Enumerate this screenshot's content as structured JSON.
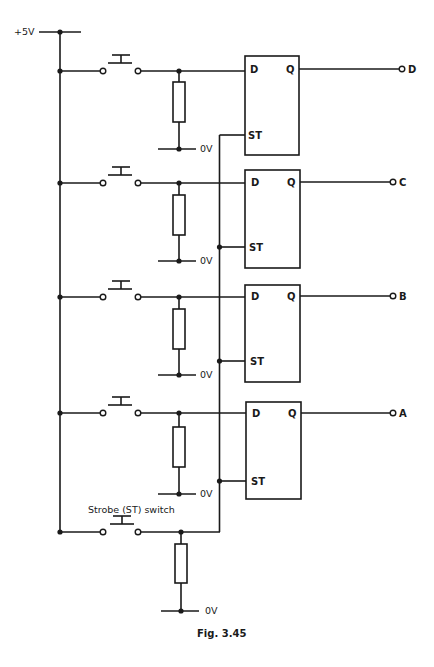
{
  "figure": {
    "caption": "Fig. 3.45",
    "supply_label": "+5V",
    "ground_label": "0V",
    "strobe_switch_label": "Strobe (ST) switch"
  },
  "latches": [
    {
      "d_label": "D",
      "q_label": "Q",
      "st_label": "ST",
      "output_label": "D"
    },
    {
      "d_label": "D",
      "q_label": "Q",
      "st_label": "ST",
      "output_label": "C"
    },
    {
      "d_label": "D",
      "q_label": "Q",
      "st_label": "ST",
      "output_label": "B"
    },
    {
      "d_label": "D",
      "q_label": "Q",
      "st_label": "ST",
      "output_label": "A"
    }
  ],
  "ground_labels": [
    "0V",
    "0V",
    "0V",
    "0V",
    "0V"
  ]
}
